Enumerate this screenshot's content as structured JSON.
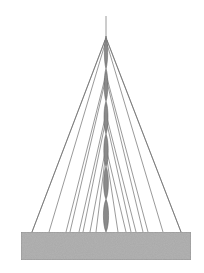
{
  "diagram": {
    "mast": {
      "segments": 6,
      "color": "#8a8a8a",
      "outline_color": "#5a5a5a",
      "tip_color": "#9a9a9a"
    },
    "guy_wires": {
      "count_left": 8,
      "count_right": 8,
      "color": "#6e6e6e"
    },
    "base": {
      "fill_color": "#a9a9a9",
      "edge_color": "#7a7a7a"
    }
  }
}
